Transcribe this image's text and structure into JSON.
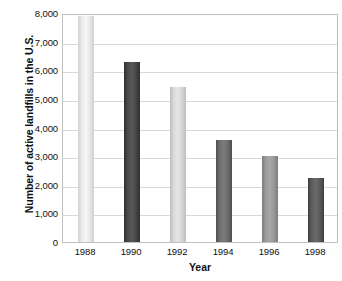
{
  "chart_data": {
    "type": "bar",
    "title": "",
    "subtitle": "",
    "xlabel": "Year",
    "ylabel": "Number of active landfills in the U.S.",
    "categories": [
      "1988",
      "1990",
      "1992",
      "1994",
      "1996",
      "1998"
    ],
    "values": [
      7900,
      6300,
      5400,
      3550,
      3000,
      2250
    ],
    "series": [
      {
        "name": "Active landfills",
        "values": [
          7900,
          6300,
          5400,
          3550,
          3000,
          2250
        ]
      }
    ],
    "ylim": [
      0,
      8000
    ],
    "y_ticks": [
      0,
      1000,
      2000,
      3000,
      4000,
      5000,
      6000,
      7000,
      8000
    ],
    "y_tick_labels": [
      "0",
      "1,000",
      "2,000",
      "3,000",
      "4,000",
      "5,000",
      "6,000",
      "7,000",
      "8,000"
    ],
    "x_tick_labels": [
      "1988",
      "1990",
      "1992",
      "1994",
      "1996",
      "1998"
    ],
    "grid": true,
    "legend": false,
    "legend_position": "none",
    "bar_colors": [
      "#e9e9e9",
      "#4a4a4a",
      "#d8d8d8",
      "#6e6e6e",
      "#9a9a9a",
      "#5c5c5c"
    ],
    "bar_edge_colors": [
      "#cfcfcf",
      "#2e2e2e",
      "#bdbdbd",
      "#4f4f4f",
      "#7d7d7d",
      "#3f3f3f"
    ],
    "plot_border_color": "#bfbfbf",
    "gridline_color": "#d8d8d8",
    "text_color": "#101010",
    "background_color": "#ffffff"
  }
}
